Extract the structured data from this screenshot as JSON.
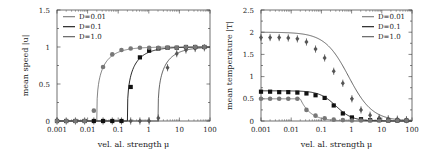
{
  "chart_data": [
    {
      "type": "line",
      "title": "",
      "xlabel": "vel. al. strength μ",
      "ylabel": "mean speed |u|",
      "xscale": "log",
      "xlim": [
        0.001,
        100
      ],
      "ylim": [
        0,
        1.5
      ],
      "xticks": [
        "0.001",
        "0.01",
        "0.1",
        "1",
        "10",
        "100"
      ],
      "yticks": [
        "0",
        "0.5",
        "1",
        "1.5"
      ],
      "legend_position": "upper left",
      "legend": [
        "D=0.01",
        "D=0.1",
        "D=1.0"
      ],
      "series": [
        {
          "name": "D=0.01",
          "color": "#777777",
          "marker": "circle",
          "x": [
            0.001,
            0.002,
            0.004,
            0.008,
            0.016,
            0.032,
            0.064,
            0.128,
            0.256,
            0.512,
            1.024,
            2.048,
            4.096,
            8.192,
            16.384,
            32.768,
            65.536
          ],
          "values": [
            0,
            0,
            0,
            0,
            0.14,
            0.73,
            0.9,
            0.96,
            0.98,
            0.99,
            0.99,
            0.99,
            0.99,
            0.99,
            1.0,
            1.0,
            1.0
          ],
          "fit_threshold": 0.02
        },
        {
          "name": "D=0.1",
          "color": "#111111",
          "marker": "square",
          "x": [
            0.001,
            0.002,
            0.004,
            0.008,
            0.016,
            0.032,
            0.064,
            0.128,
            0.256,
            0.512,
            1.024,
            2.048,
            4.096,
            8.192,
            16.384,
            32.768,
            65.536
          ],
          "values": [
            0,
            0,
            0,
            0,
            0,
            0,
            0,
            0,
            0.46,
            0.86,
            0.95,
            0.98,
            0.99,
            0.99,
            1.0,
            1.0,
            1.0
          ],
          "fit_threshold": 0.2
        },
        {
          "name": "D=1.0",
          "color": "#555555",
          "marker": "diamond",
          "x": [
            0.001,
            0.002,
            0.004,
            0.008,
            0.016,
            0.032,
            0.064,
            0.128,
            0.256,
            0.512,
            1.024,
            2.048,
            4.096,
            8.192,
            16.384,
            32.768,
            65.536
          ],
          "values": [
            0,
            0,
            0,
            0,
            0,
            0,
            0,
            0,
            0,
            0,
            0,
            0.04,
            0.72,
            0.91,
            0.96,
            0.98,
            0.99
          ],
          "fit_threshold": 2.0
        }
      ]
    },
    {
      "type": "line",
      "title": "",
      "xlabel": "vel. al. strength μ",
      "ylabel": "mean temperature |T|",
      "xscale": "log",
      "xlim": [
        0.001,
        100
      ],
      "ylim": [
        0,
        2.5
      ],
      "xticks": [
        "0.001",
        "0.01",
        "0.1",
        "1",
        "10",
        "100"
      ],
      "yticks": [
        "0",
        "0.5",
        "1",
        "1.5",
        "2",
        "2.5"
      ],
      "legend_position": "upper right",
      "legend": [
        "D=0.01",
        "D=0.1",
        "D=1.0"
      ],
      "series": [
        {
          "name": "D=0.01",
          "color": "#777777",
          "marker": "circle",
          "x": [
            0.001,
            0.002,
            0.004,
            0.008,
            0.016,
            0.032,
            0.064,
            0.128,
            0.256,
            0.512,
            1.024,
            2.048,
            4.096,
            8.192,
            16.384,
            32.768,
            65.536
          ],
          "values": [
            0.5,
            0.5,
            0.5,
            0.5,
            0.5,
            0.25,
            0.12,
            0.06,
            0.03,
            0.02,
            0.01,
            0.01,
            0.01,
            0.01,
            0.01,
            0.01,
            0.01
          ],
          "fit_plateau": 0.5,
          "fit_threshold": 0.02
        },
        {
          "name": "D=0.1",
          "color": "#111111",
          "marker": "square",
          "x": [
            0.001,
            0.002,
            0.004,
            0.008,
            0.016,
            0.032,
            0.064,
            0.128,
            0.256,
            0.512,
            1.024,
            2.048,
            4.096,
            8.192,
            16.384,
            32.768,
            65.536
          ],
          "values": [
            0.66,
            0.66,
            0.65,
            0.65,
            0.64,
            0.62,
            0.58,
            0.52,
            0.35,
            0.17,
            0.08,
            0.04,
            0.02,
            0.02,
            0.01,
            0.01,
            0.01
          ],
          "fit_plateau": 0.68
        },
        {
          "name": "D=1.0",
          "color": "#555555",
          "marker": "diamond",
          "x": [
            0.001,
            0.002,
            0.004,
            0.008,
            0.016,
            0.032,
            0.064,
            0.128,
            0.256,
            0.512,
            1.024,
            2.048,
            4.096,
            8.192,
            16.384,
            32.768,
            65.536
          ],
          "values": [
            1.88,
            1.88,
            1.88,
            1.87,
            1.85,
            1.78,
            1.62,
            1.42,
            1.12,
            0.85,
            0.5,
            0.25,
            0.13,
            0.07,
            0.05,
            0.04,
            0.03
          ],
          "fit_plateau": 2.0
        }
      ]
    }
  ]
}
